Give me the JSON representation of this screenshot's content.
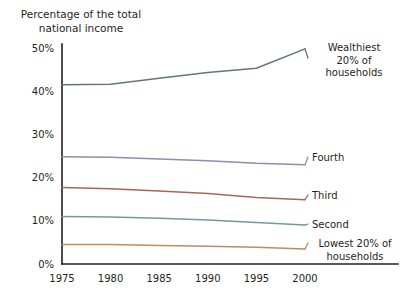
{
  "chart_data": {
    "type": "line",
    "title": "Percentage of the total\nnational income",
    "xlabel": "",
    "ylabel": "",
    "xlim": [
      1975,
      2000
    ],
    "ylim": [
      0,
      50
    ],
    "grid": false,
    "legend_position": "right-inline-labels",
    "x": [
      1975,
      1980,
      1985,
      1990,
      1995,
      2000
    ],
    "xtick_labels": [
      "1975",
      "1980",
      "1985",
      "1990",
      "1995",
      "2000"
    ],
    "ytick_labels": [
      "0%",
      "10%",
      "20%",
      "30%",
      "40%",
      "50%"
    ],
    "ytick_values": [
      0,
      10,
      20,
      30,
      40,
      50
    ],
    "series": [
      {
        "name": "Wealthiest 20% of households",
        "label": "Wealthiest\n20% of\nhouseholds",
        "color": "#5f7a68",
        "values": [
          41.5,
          41.6,
          43.0,
          44.3,
          45.3,
          49.8
        ]
      },
      {
        "name": "Fourth",
        "label": "Fourth",
        "color": "#8a90ad",
        "values": [
          24.8,
          24.7,
          24.3,
          23.9,
          23.3,
          23.0
        ]
      },
      {
        "name": "Third",
        "label": "Third",
        "color": "#a8655c",
        "values": [
          17.7,
          17.4,
          16.9,
          16.3,
          15.4,
          14.9
        ]
      },
      {
        "name": "Second",
        "label": "Second",
        "color": "#6f9ba0",
        "values": [
          11.0,
          10.9,
          10.6,
          10.2,
          9.6,
          9.0
        ]
      },
      {
        "name": "Lowest 20% of households",
        "label": "Lowest 20% of\nhouseholds",
        "color": "#c08a62",
        "values": [
          4.5,
          4.5,
          4.3,
          4.1,
          3.9,
          3.5
        ]
      }
    ]
  }
}
